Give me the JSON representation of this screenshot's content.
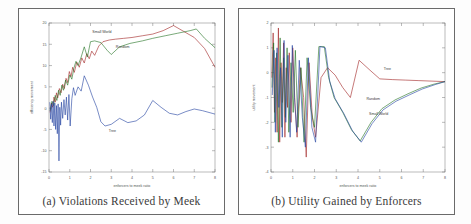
{
  "figure": {
    "panels": [
      {
        "id": "a",
        "caption": "(a) Violations Received by Meek",
        "xlabel": "enforcers to meek ratio",
        "ylabel": "efficiency movement",
        "xticks": [
          "0",
          "1",
          "2",
          "3",
          "4",
          "5",
          "6",
          "7",
          "8"
        ],
        "yticks": [
          "20",
          "15",
          "10",
          "5",
          "0",
          "-5",
          "-10",
          "-15"
        ],
        "series_labels": [
          "Small World",
          "Random",
          "Tree"
        ]
      },
      {
        "id": "b",
        "caption": "(b) Utility Gained by Enforcers",
        "xlabel": "enforcers to meek ratio",
        "ylabel": "utility movement",
        "xticks": [
          "0",
          "1",
          "2",
          "3",
          "4",
          "5",
          "6",
          "7",
          "8"
        ],
        "yticks": [
          "2",
          "1",
          "0",
          "-1",
          "-2",
          "-3",
          "-4"
        ],
        "series_labels": [
          "Tree",
          "Random",
          "Small World"
        ]
      }
    ]
  },
  "chart_data": [
    {
      "type": "line",
      "title": "(a) Violations Received by Meek",
      "xlabel": "enforcers to meek ratio",
      "ylabel": "efficiency movement",
      "xlim": [
        0,
        8
      ],
      "ylim": [
        -15,
        20
      ],
      "xticks": [
        0,
        1,
        2,
        3,
        4,
        5,
        6,
        7,
        8
      ],
      "yticks": [
        -15,
        -10,
        -5,
        0,
        5,
        10,
        15,
        20
      ],
      "grid": false,
      "legend": "inline-annotations",
      "series": [
        {
          "name": "Small World",
          "label_at": [
            2.55,
            17.6
          ],
          "points": [
            [
              0.05,
              -1.0
            ],
            [
              0.12,
              1.2
            ],
            [
              0.18,
              0.2
            ],
            [
              0.24,
              2.6
            ],
            [
              0.3,
              1.4
            ],
            [
              0.36,
              3.6
            ],
            [
              0.42,
              2.4
            ],
            [
              0.5,
              4.6
            ],
            [
              0.58,
              3.6
            ],
            [
              0.66,
              5.6
            ],
            [
              0.74,
              4.6
            ],
            [
              0.82,
              7.0
            ],
            [
              0.9,
              6.0
            ],
            [
              0.98,
              8.6
            ],
            [
              1.06,
              7.4
            ],
            [
              1.14,
              9.6
            ],
            [
              1.22,
              8.4
            ],
            [
              1.34,
              10.8
            ],
            [
              1.46,
              9.6
            ],
            [
              1.58,
              11.8
            ],
            [
              1.7,
              10.6
            ],
            [
              1.82,
              12.8
            ],
            [
              1.94,
              11.6
            ],
            [
              2.06,
              13.4
            ],
            [
              2.2,
              12.4
            ],
            [
              2.4,
              14.6
            ],
            [
              2.6,
              15.6
            ],
            [
              2.9,
              16.0
            ],
            [
              3.2,
              16.2
            ],
            [
              3.6,
              16.4
            ],
            [
              4.0,
              16.6
            ],
            [
              4.5,
              17.0
            ],
            [
              5.0,
              17.4
            ],
            [
              5.5,
              18.2
            ],
            [
              6.0,
              19.4
            ],
            [
              6.5,
              18.0
            ],
            [
              7.0,
              16.6
            ],
            [
              7.5,
              14.0
            ],
            [
              8.0,
              9.6
            ]
          ]
        },
        {
          "name": "Random",
          "label_at": [
            3.55,
            14.2
          ],
          "points": [
            [
              0.05,
              -0.6
            ],
            [
              0.14,
              1.6
            ],
            [
              0.22,
              0.6
            ],
            [
              0.3,
              3.0
            ],
            [
              0.38,
              1.8
            ],
            [
              0.46,
              4.2
            ],
            [
              0.54,
              3.0
            ],
            [
              0.62,
              5.4
            ],
            [
              0.7,
              4.2
            ],
            [
              0.8,
              6.6
            ],
            [
              0.9,
              5.4
            ],
            [
              1.0,
              7.8
            ],
            [
              1.1,
              6.8
            ],
            [
              1.2,
              9.4
            ],
            [
              1.3,
              11.0
            ],
            [
              1.4,
              10.0
            ],
            [
              1.55,
              12.0
            ],
            [
              1.7,
              14.4
            ],
            [
              1.85,
              12.0
            ],
            [
              2.0,
              15.6
            ],
            [
              2.2,
              15.8
            ],
            [
              2.5,
              15.4
            ],
            [
              2.8,
              13.6
            ],
            [
              3.0,
              12.6
            ],
            [
              3.4,
              14.4
            ],
            [
              3.9,
              15.2
            ],
            [
              4.5,
              15.8
            ],
            [
              5.0,
              16.4
            ],
            [
              5.6,
              17.0
            ],
            [
              6.2,
              17.6
            ],
            [
              6.8,
              18.2
            ],
            [
              7.1,
              18.6
            ],
            [
              7.5,
              16.4
            ],
            [
              8.0,
              14.2
            ]
          ]
        },
        {
          "name": "Tree",
          "label_at": [
            3.05,
            -5.6
          ],
          "points": [
            [
              0.04,
              1.4
            ],
            [
              0.08,
              -2.6
            ],
            [
              0.12,
              1.0
            ],
            [
              0.16,
              -3.4
            ],
            [
              0.2,
              1.6
            ],
            [
              0.24,
              -4.2
            ],
            [
              0.28,
              1.2
            ],
            [
              0.32,
              -5.0
            ],
            [
              0.36,
              0.6
            ],
            [
              0.4,
              -6.0
            ],
            [
              0.44,
              1.0
            ],
            [
              0.48,
              -12.4
            ],
            [
              0.52,
              0.2
            ],
            [
              0.56,
              -4.0
            ],
            [
              0.6,
              1.4
            ],
            [
              0.66,
              -2.4
            ],
            [
              0.72,
              2.0
            ],
            [
              0.78,
              -1.6
            ],
            [
              0.84,
              2.6
            ],
            [
              0.9,
              -2.8
            ],
            [
              0.96,
              3.2
            ],
            [
              1.02,
              -4.2
            ],
            [
              1.1,
              2.2
            ],
            [
              1.18,
              4.8
            ],
            [
              1.26,
              3.0
            ],
            [
              1.4,
              5.0
            ],
            [
              1.55,
              4.0
            ],
            [
              1.7,
              7.6
            ],
            [
              1.9,
              5.4
            ],
            [
              2.1,
              2.6
            ],
            [
              2.3,
              0.2
            ],
            [
              2.5,
              -3.2
            ],
            [
              2.7,
              -4.2
            ],
            [
              3.0,
              -3.8
            ],
            [
              3.4,
              -2.4
            ],
            [
              3.8,
              -3.4
            ],
            [
              4.2,
              -3.0
            ],
            [
              4.6,
              -1.6
            ],
            [
              5.0,
              1.8
            ],
            [
              5.4,
              0.2
            ],
            [
              5.8,
              -1.2
            ],
            [
              6.2,
              -1.6
            ],
            [
              6.6,
              -0.8
            ],
            [
              7.0,
              -0.2
            ],
            [
              7.4,
              -0.6
            ],
            [
              8.0,
              -1.4
            ]
          ]
        }
      ]
    },
    {
      "type": "line",
      "title": "(b) Utility Gained by Enforcers",
      "xlabel": "enforcers to meek ratio",
      "ylabel": "utility movement",
      "xlim": [
        0,
        8
      ],
      "ylim": [
        -4,
        2
      ],
      "xticks": [
        0,
        1,
        2,
        3,
        4,
        5,
        6,
        7,
        8
      ],
      "yticks": [
        -4,
        -3,
        -2,
        -1,
        0,
        1,
        2
      ],
      "grid": false,
      "legend": "inline-annotations",
      "series": [
        {
          "name": "Tree",
          "label_at": [
            5.35,
            0.1
          ],
          "points": [
            [
              0.04,
              -0.2
            ],
            [
              0.1,
              1.6
            ],
            [
              0.16,
              -1.6
            ],
            [
              0.22,
              0.6
            ],
            [
              0.28,
              -2.4
            ],
            [
              0.34,
              1.8
            ],
            [
              0.4,
              -2.8
            ],
            [
              0.46,
              0.4
            ],
            [
              0.52,
              -1.2
            ],
            [
              0.58,
              1.2
            ],
            [
              0.64,
              -2.6
            ],
            [
              0.7,
              0.2
            ],
            [
              0.76,
              -1.4
            ],
            [
              0.84,
              0.8
            ],
            [
              0.92,
              -2.0
            ],
            [
              1.0,
              1.0
            ],
            [
              1.1,
              -1.2
            ],
            [
              1.2,
              -2.6
            ],
            [
              1.35,
              0.2
            ],
            [
              1.5,
              -1.0
            ],
            [
              1.62,
              -3.4
            ],
            [
              1.75,
              0.4
            ],
            [
              1.9,
              -1.8
            ],
            [
              2.05,
              -2.6
            ],
            [
              2.3,
              -0.2
            ],
            [
              2.6,
              0.2
            ],
            [
              2.95,
              -0.1
            ],
            [
              3.3,
              -0.6
            ],
            [
              3.65,
              -1.0
            ],
            [
              4.05,
              0.5
            ],
            [
              4.55,
              0.1
            ],
            [
              5.0,
              -0.25
            ],
            [
              5.6,
              -0.28
            ],
            [
              6.2,
              -0.3
            ],
            [
              6.8,
              -0.32
            ],
            [
              7.4,
              -0.34
            ],
            [
              8.0,
              -0.36
            ]
          ]
        },
        {
          "name": "Random",
          "label_at": [
            4.7,
            -1.12
          ],
          "points": [
            [
              0.05,
              -0.6
            ],
            [
              0.12,
              1.2
            ],
            [
              0.18,
              -2.0
            ],
            [
              0.26,
              0.8
            ],
            [
              0.34,
              -2.8
            ],
            [
              0.42,
              1.4
            ],
            [
              0.5,
              -2.2
            ],
            [
              0.58,
              0.6
            ],
            [
              0.66,
              -1.8
            ],
            [
              0.74,
              1.0
            ],
            [
              0.82,
              -2.4
            ],
            [
              0.92,
              0.4
            ],
            [
              1.02,
              -1.6
            ],
            [
              1.12,
              0.9
            ],
            [
              1.24,
              -2.2
            ],
            [
              1.38,
              0.2
            ],
            [
              1.52,
              -2.8
            ],
            [
              1.66,
              0.6
            ],
            [
              1.82,
              -1.4
            ],
            [
              2.0,
              -2.2
            ],
            [
              2.2,
              1.05
            ],
            [
              2.45,
              1.05
            ],
            [
              2.65,
              -0.2
            ],
            [
              2.9,
              -1.0
            ],
            [
              3.3,
              -1.6
            ],
            [
              3.7,
              -2.3
            ],
            [
              4.1,
              -2.75
            ],
            [
              4.6,
              -2.0
            ],
            [
              5.1,
              -1.45
            ],
            [
              5.7,
              -1.1
            ],
            [
              6.3,
              -0.85
            ],
            [
              6.9,
              -0.62
            ],
            [
              7.5,
              -0.46
            ],
            [
              8.0,
              -0.36
            ]
          ]
        },
        {
          "name": "Small World",
          "label_at": [
            4.95,
            -1.72
          ],
          "points": [
            [
              0.06,
              -0.9
            ],
            [
              0.14,
              0.9
            ],
            [
              0.2,
              -2.4
            ],
            [
              0.28,
              1.0
            ],
            [
              0.36,
              -1.4
            ],
            [
              0.44,
              0.2
            ],
            [
              0.52,
              -2.6
            ],
            [
              0.6,
              1.3
            ],
            [
              0.68,
              -2.0
            ],
            [
              0.78,
              0.7
            ],
            [
              0.88,
              -2.6
            ],
            [
              0.98,
              1.1
            ],
            [
              1.08,
              -1.0
            ],
            [
              1.18,
              -2.4
            ],
            [
              1.3,
              0.5
            ],
            [
              1.44,
              -1.8
            ],
            [
              1.58,
              -3.0
            ],
            [
              1.72,
              0.6
            ],
            [
              1.88,
              -2.2
            ],
            [
              2.05,
              -2.8
            ],
            [
              2.25,
              1.05
            ],
            [
              2.5,
              1.0
            ],
            [
              2.7,
              -0.35
            ],
            [
              2.95,
              -1.05
            ],
            [
              3.35,
              -1.65
            ],
            [
              3.75,
              -2.35
            ],
            [
              4.15,
              -2.8
            ],
            [
              4.65,
              -2.05
            ],
            [
              5.15,
              -1.5
            ],
            [
              5.75,
              -1.15
            ],
            [
              6.35,
              -0.9
            ],
            [
              6.95,
              -0.66
            ],
            [
              7.55,
              -0.48
            ],
            [
              8.0,
              -0.36
            ]
          ]
        }
      ]
    }
  ]
}
